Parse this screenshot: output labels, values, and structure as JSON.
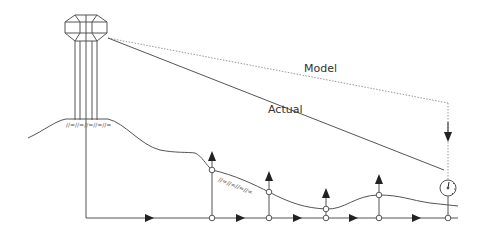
{
  "diagram": {
    "labels": {
      "model": "Model",
      "actual": "Actual"
    },
    "colors": {
      "line": "#555555",
      "dotted": "#999999",
      "arrow": "#222222",
      "background": "#ffffff"
    },
    "components": [
      "water-tower",
      "terrain",
      "distribution-pipe",
      "service-nodes",
      "pressure-gauge"
    ],
    "nodes_x": [
      212,
      269,
      326,
      379,
      448
    ]
  }
}
